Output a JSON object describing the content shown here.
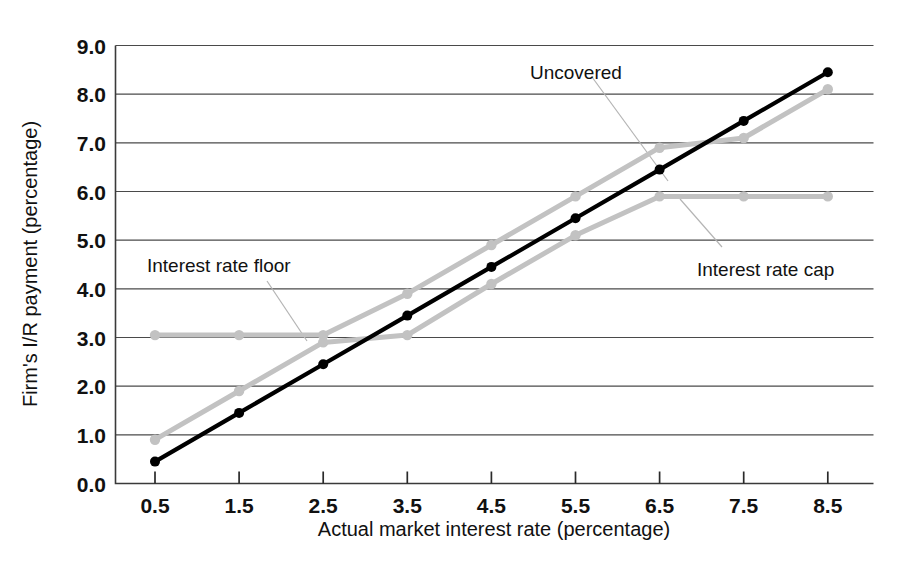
{
  "chart_data": {
    "type": "line",
    "title": "",
    "subtitle": "",
    "xlabel": "Actual market interest rate (percentage)",
    "ylabel": "Firm's I/R payment (percentage)",
    "x": [
      0.5,
      1.5,
      2.5,
      3.5,
      4.5,
      5.5,
      6.5,
      7.5,
      8.5
    ],
    "categories": [
      "0.5",
      "1.5",
      "2.5",
      "3.5",
      "4.5",
      "5.5",
      "6.5",
      "7.5",
      "8.5"
    ],
    "xlim": [
      0.5,
      8.5
    ],
    "ylim": [
      0.0,
      9.0
    ],
    "yticks": [
      "0.0",
      "1.0",
      "2.0",
      "3.0",
      "4.0",
      "5.0",
      "6.0",
      "7.0",
      "8.0",
      "9.0"
    ],
    "ytick_values": [
      0.0,
      1.0,
      2.0,
      3.0,
      4.0,
      5.0,
      6.0,
      7.0,
      8.0,
      9.0
    ],
    "grid": "horizontal",
    "legend": "inline-annotations",
    "series": [
      {
        "name": "Uncovered",
        "color": "#000000",
        "values": [
          0.45,
          1.45,
          2.45,
          3.45,
          4.45,
          5.45,
          6.45,
          7.45,
          8.45
        ]
      },
      {
        "name": "Interest rate floor",
        "color": "#c2c2c2",
        "values": [
          3.05,
          3.05,
          3.05,
          3.9,
          4.9,
          5.9,
          6.9,
          7.1,
          8.1
        ]
      },
      {
        "name": "Interest rate cap",
        "color": "#c2c2c2",
        "values": [
          0.9,
          1.9,
          2.9,
          3.05,
          4.1,
          5.1,
          5.9,
          5.9,
          5.9
        ]
      }
    ],
    "annotations": [
      {
        "text": "Uncovered",
        "x": 5.85,
        "y": 8.45
      },
      {
        "text": "Interest rate floor",
        "x": 1.55,
        "y": 4.55
      },
      {
        "text": "Interest rate cap",
        "x": 6.55,
        "y": 4.45
      }
    ]
  },
  "axis": {
    "x_title": "Actual market interest rate (percentage)",
    "y_title": "Firm's I/R payment (percentage)",
    "x_ticks": [
      "0.5",
      "1.5",
      "2.5",
      "3.5",
      "4.5",
      "5.5",
      "6.5",
      "7.5",
      "8.5"
    ],
    "y_ticks": [
      "9.0",
      "8.0",
      "7.0",
      "6.0",
      "5.0",
      "4.0",
      "3.0",
      "2.0",
      "1.0",
      "0.0"
    ]
  },
  "labels": {
    "uncovered": "Uncovered",
    "interest_rate_floor": "Interest rate floor",
    "interest_rate_cap": "Interest rate cap"
  },
  "colors": {
    "uncovered_line": "#000000",
    "covered_line": "#c2c2c2",
    "gridline": "#4a4a4a",
    "background": "#ffffff"
  }
}
